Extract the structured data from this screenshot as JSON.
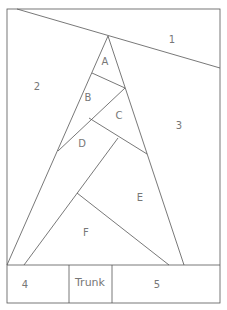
{
  "diagram": {
    "type": "paper-piecing pattern",
    "line_color": "#555555",
    "label_color": "#777777",
    "labels": {
      "r1": "1",
      "r2": "2",
      "r3": "3",
      "r4": "4",
      "r5": "5",
      "trunk": "Trunk",
      "a": "A",
      "b": "B",
      "c": "C",
      "d": "D",
      "e": "E",
      "f": "F"
    }
  }
}
